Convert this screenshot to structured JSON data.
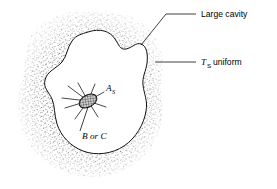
{
  "figure": {
    "background_color": "#ffffff",
    "ink_color": "#000000",
    "stipple_color": "#6b6b6b",
    "cavity_fill": "#ffffff",
    "annotations": {
      "large_cavity": {
        "label": "Large cavity",
        "leader": "diagonal-down-left"
      },
      "ts_uniform": {
        "symbol": "T",
        "subscript": "S",
        "label": "uniform",
        "leader": "horizontal-left"
      },
      "surface_area": {
        "symbol": "A",
        "subscript": "S"
      },
      "emission_label": {
        "text": "B or C",
        "leader": "vertical-up"
      }
    },
    "elements": {
      "stippled_solid_name": "stippled-solid-medium",
      "cavity_name": "large-cavity-interior",
      "small_surface_name": "small-surface-patch",
      "rays_name": "radiation-rays",
      "ray_count": 8
    }
  }
}
